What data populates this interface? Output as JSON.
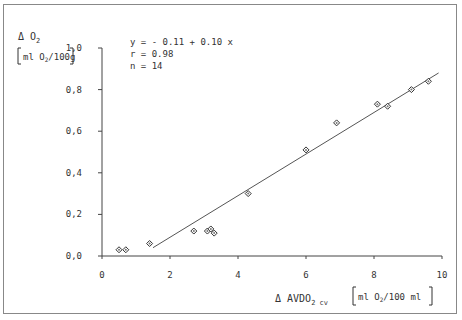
{
  "chart_data": {
    "type": "scatter",
    "title": "",
    "ylabel": "Δ O2 [ml O2/100g]",
    "ylabel_line1": "Δ O",
    "ylabel_sub1": "2",
    "ylabel_line2": "ml O",
    "ylabel_sub2": "2",
    "ylabel_line2b": "/100g",
    "xlabel": "Δ AVDO2 cv [ml O2/100 ml]",
    "xlabel_main": "Δ AVDO",
    "xlabel_sub": "2 cv",
    "xlabel_unit_a": "ml O",
    "xlabel_unit_sub": "2",
    "xlabel_unit_b": "/100 ml",
    "xlim": [
      0,
      10
    ],
    "ylim": [
      0.0,
      1.0
    ],
    "x_ticks": [
      "0",
      "2",
      "4",
      "6",
      "8",
      "10"
    ],
    "y_ticks": [
      "0,0",
      "0,2",
      "0,4",
      "0,6",
      "0,8",
      "1,0"
    ],
    "grid": false,
    "annotation": {
      "equation": "y = - 0.11 + 0.10 x",
      "r": "r = 0.98",
      "n": "n = 14"
    },
    "series": [
      {
        "name": "measurements",
        "marker": "diamond",
        "points": [
          {
            "x": 0.5,
            "y": 0.03
          },
          {
            "x": 0.7,
            "y": 0.03
          },
          {
            "x": 1.4,
            "y": 0.06
          },
          {
            "x": 2.7,
            "y": 0.12
          },
          {
            "x": 3.1,
            "y": 0.12
          },
          {
            "x": 3.2,
            "y": 0.13
          },
          {
            "x": 3.3,
            "y": 0.11
          },
          {
            "x": 4.3,
            "y": 0.3
          },
          {
            "x": 6.0,
            "y": 0.51
          },
          {
            "x": 6.9,
            "y": 0.64
          },
          {
            "x": 8.1,
            "y": 0.73
          },
          {
            "x": 8.4,
            "y": 0.72
          },
          {
            "x": 9.1,
            "y": 0.8
          },
          {
            "x": 9.6,
            "y": 0.84
          }
        ]
      }
    ],
    "regression_line": {
      "x_start": 1.5,
      "y_start": 0.04,
      "x_end": 9.9,
      "y_end": 0.88
    }
  }
}
